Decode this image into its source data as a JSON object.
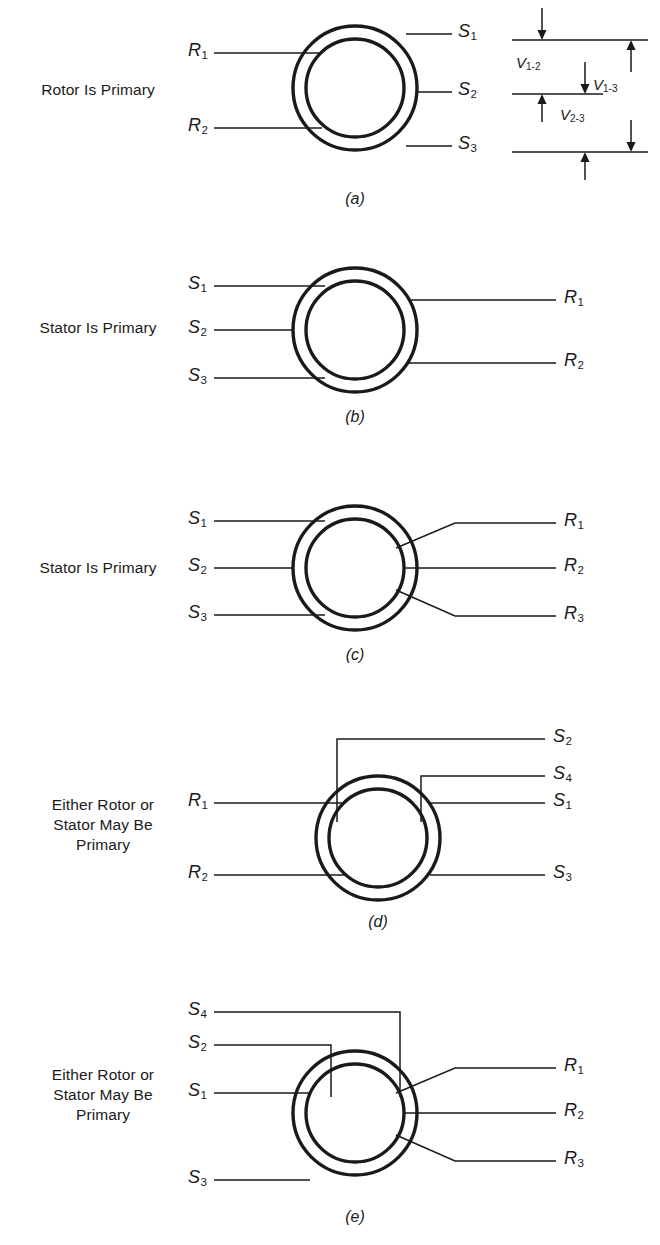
{
  "figure": {
    "type": "synchro-resolver-wiring-diagram",
    "panel_count": 5
  },
  "panels": [
    {
      "id": "a",
      "caption": "(a)",
      "description": "Rotor Is Primary",
      "description_lines": [
        "Rotor Is Primary"
      ],
      "left_terminals": [
        {
          "base": "R",
          "sub": "1"
        },
        {
          "base": "R",
          "sub": "2"
        }
      ],
      "right_terminals": [
        {
          "base": "S",
          "sub": "1"
        },
        {
          "base": "S",
          "sub": "2"
        },
        {
          "base": "S",
          "sub": "3"
        }
      ],
      "has_voltage_diagram": true,
      "voltage_labels": [
        {
          "base": "V",
          "sub": "1-2"
        },
        {
          "base": "V",
          "sub": "2-3"
        },
        {
          "base": "V",
          "sub": "1-3"
        }
      ]
    },
    {
      "id": "b",
      "caption": "(b)",
      "description": "Stator Is Primary",
      "description_lines": [
        "Stator Is Primary"
      ],
      "left_terminals": [
        {
          "base": "S",
          "sub": "1"
        },
        {
          "base": "S",
          "sub": "2"
        },
        {
          "base": "S",
          "sub": "3"
        }
      ],
      "right_terminals": [
        {
          "base": "R",
          "sub": "1"
        },
        {
          "base": "R",
          "sub": "2"
        }
      ],
      "has_voltage_diagram": false
    },
    {
      "id": "c",
      "caption": "(c)",
      "description": "Stator Is Primary",
      "description_lines": [
        "Stator Is Primary"
      ],
      "left_terminals": [
        {
          "base": "S",
          "sub": "1"
        },
        {
          "base": "S",
          "sub": "2"
        },
        {
          "base": "S",
          "sub": "3"
        }
      ],
      "right_terminals": [
        {
          "base": "R",
          "sub": "1"
        },
        {
          "base": "R",
          "sub": "2"
        },
        {
          "base": "R",
          "sub": "3"
        }
      ],
      "has_voltage_diagram": false
    },
    {
      "id": "d",
      "caption": "(d)",
      "description": "Either Rotor or Stator May Be Primary",
      "description_lines": [
        "Either Rotor or",
        "Stator May Be",
        "Primary"
      ],
      "left_terminals": [
        {
          "base": "R",
          "sub": "1"
        },
        {
          "base": "R",
          "sub": "2"
        }
      ],
      "right_terminals": [
        {
          "base": "S",
          "sub": "2"
        },
        {
          "base": "S",
          "sub": "4"
        },
        {
          "base": "S",
          "sub": "1"
        },
        {
          "base": "S",
          "sub": "3"
        }
      ],
      "has_voltage_diagram": false
    },
    {
      "id": "e",
      "caption": "(e)",
      "description": "Either Rotor or Stator May Be Primary",
      "description_lines": [
        "Either Rotor or",
        "Stator May Be",
        "Primary"
      ],
      "left_terminals": [
        {
          "base": "S",
          "sub": "4"
        },
        {
          "base": "S",
          "sub": "2"
        },
        {
          "base": "S",
          "sub": "1"
        },
        {
          "base": "S",
          "sub": "3"
        }
      ],
      "right_terminals": [
        {
          "base": "R",
          "sub": "1"
        },
        {
          "base": "R",
          "sub": "2"
        },
        {
          "base": "R",
          "sub": "3"
        }
      ],
      "has_voltage_diagram": false
    }
  ],
  "colors": {
    "ink": "#1a1a1a",
    "background": "#ffffff"
  }
}
